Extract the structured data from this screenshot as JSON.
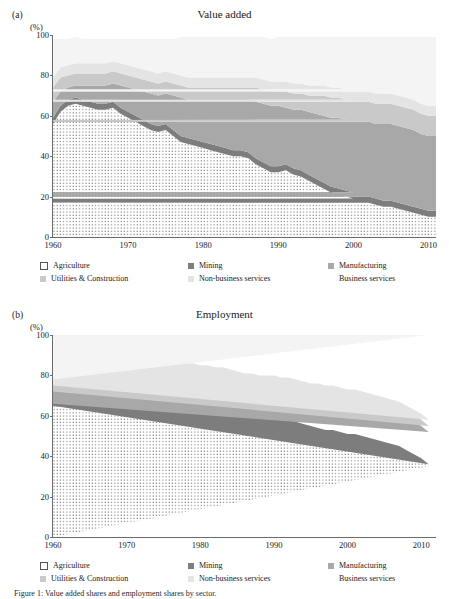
{
  "figure": {
    "caption": "Figure 1: Value added shares and employment shares by sector."
  },
  "legend": {
    "items": [
      {
        "label": "Agriculture",
        "key": "agriculture",
        "swatch": "sw-agri",
        "color": "#ffffff"
      },
      {
        "label": "Mining",
        "key": "mining",
        "swatch": "sw-min",
        "color": "#7d7d7d"
      },
      {
        "label": "Manufacturing",
        "key": "manufacturing",
        "swatch": "sw-man",
        "color": "#a8a8a8"
      },
      {
        "label": "Utilities & Construction",
        "key": "utilities",
        "swatch": "sw-uti",
        "color": "#c9c9c9"
      },
      {
        "label": "Non-business services",
        "key": "nonbusiness",
        "swatch": "sw-nbs",
        "color": "#e4e4e4"
      },
      {
        "label": "Business services",
        "key": "business",
        "swatch": "sw-bus",
        "color": "#f4f4f4"
      }
    ]
  },
  "panels": [
    {
      "letter": "(a)",
      "title": "Value added",
      "unit": "(%)"
    },
    {
      "letter": "(b)",
      "title": "Employment",
      "unit": "(%)"
    }
  ],
  "chart_data": [
    {
      "type": "area",
      "stacked": true,
      "title": "Value added",
      "panel": "(a)",
      "xlabel": "",
      "ylabel": "(%)",
      "ylim": [
        0,
        100
      ],
      "xlim": [
        1960,
        2011
      ],
      "yticks": [
        0,
        20,
        40,
        60,
        80,
        100
      ],
      "xticks": [
        1960,
        1970,
        1980,
        1990,
        2000,
        2010
      ],
      "grid": false,
      "legend_position": "below",
      "x": [
        1960,
        1961,
        1962,
        1963,
        1964,
        1965,
        1966,
        1967,
        1968,
        1969,
        1970,
        1971,
        1972,
        1973,
        1974,
        1975,
        1976,
        1977,
        1978,
        1979,
        1980,
        1981,
        1982,
        1983,
        1984,
        1985,
        1986,
        1987,
        1988,
        1989,
        1990,
        1991,
        1992,
        1993,
        1994,
        1995,
        1996,
        1997,
        1998,
        1999,
        2000,
        1,
        2002,
        2003,
        2004,
        2005,
        2006,
        2007,
        2008,
        2009,
        2010,
        2011
      ],
      "series": [
        {
          "name": "Agriculture",
          "values": [
            56,
            62,
            65,
            66,
            65,
            64,
            63,
            63,
            64,
            61,
            59,
            57,
            55,
            53,
            52,
            53,
            50,
            47,
            46,
            45,
            44,
            43,
            42,
            41,
            40,
            40,
            39,
            36,
            34,
            32,
            32,
            33,
            31,
            30,
            28,
            26,
            24,
            22,
            21,
            20,
            19,
            18,
            17,
            16,
            15,
            15,
            14,
            13,
            12,
            11,
            10,
            10
          ]
        },
        {
          "name": "Mining",
          "values": [
            3,
            3,
            3,
            3,
            3,
            3,
            3,
            3,
            3,
            3,
            3,
            3,
            3,
            3,
            3,
            3,
            3,
            3,
            3,
            3,
            3,
            3,
            3,
            3,
            3,
            3,
            3,
            3,
            3,
            3,
            3,
            3,
            3,
            3,
            3,
            3,
            3,
            3,
            3,
            3,
            3,
            3,
            3,
            3,
            3,
            3,
            3,
            3,
            3,
            3,
            3,
            3
          ]
        },
        {
          "name": "Manufacturing",
          "values": [
            8,
            7,
            6,
            6,
            7,
            8,
            9,
            9,
            9,
            11,
            12,
            13,
            14,
            15,
            15,
            15,
            17,
            19,
            19,
            20,
            21,
            22,
            23,
            24,
            25,
            25,
            26,
            28,
            29,
            30,
            30,
            28,
            29,
            30,
            31,
            32,
            33,
            34,
            35,
            35,
            36,
            36,
            37,
            37,
            38,
            38,
            38,
            38,
            38,
            37,
            37,
            37
          ]
        },
        {
          "name": "Utilities & Construction",
          "values": [
            7,
            7,
            6,
            6,
            6,
            6,
            6,
            6,
            6,
            6,
            6,
            6,
            6,
            6,
            6,
            6,
            6,
            6,
            6,
            6,
            6,
            6,
            6,
            6,
            6,
            6,
            6,
            7,
            7,
            7,
            7,
            8,
            8,
            8,
            8,
            9,
            10,
            10,
            10,
            10,
            10,
            10,
            10,
            10,
            10,
            10,
            10,
            10,
            10,
            10,
            10,
            10
          ]
        },
        {
          "name": "Non-business services",
          "values": [
            5,
            5,
            5,
            5,
            5,
            5,
            5,
            5,
            5,
            5,
            5,
            5,
            5,
            5,
            5,
            5,
            5,
            5,
            5,
            5,
            5,
            5,
            5,
            5,
            5,
            5,
            5,
            5,
            5,
            5,
            5,
            5,
            5,
            5,
            5,
            5,
            5,
            5,
            5,
            5,
            5,
            5,
            5,
            5,
            5,
            5,
            5,
            5,
            5,
            5,
            5,
            5
          ]
        },
        {
          "name": "Business services",
          "values": [
            19,
            14,
            13,
            13,
            12,
            12,
            12,
            12,
            11,
            12,
            13,
            14,
            15,
            16,
            17,
            16,
            17,
            19,
            20,
            20,
            20,
            20,
            20,
            20,
            20,
            20,
            20,
            20,
            21,
            21,
            22,
            22,
            23,
            23,
            24,
            24,
            24,
            25,
            25,
            26,
            26,
            27,
            27,
            28,
            28,
            28,
            29,
            30,
            31,
            33,
            34,
            34
          ]
        }
      ]
    },
    {
      "type": "area",
      "stacked": true,
      "title": "Employment",
      "panel": "(b)",
      "xlabel": "",
      "ylabel": "(%)",
      "ylim": [
        0,
        100
      ],
      "xlim": [
        1960,
        2012
      ],
      "yticks": [
        0,
        20,
        40,
        60,
        80,
        100
      ],
      "xticks": [
        1960,
        1970,
        1980,
        1990,
        2000,
        2010
      ],
      "grid": false,
      "legend_position": "below",
      "x": [
        1960,
        1961,
        1962,
        1963,
        1964,
        1965,
        1966,
        1967,
        1968,
        1969,
        1970,
        1971,
        1972,
        1973,
        1974,
        1975,
        1976,
        1977,
        1978,
        1979,
        1980,
        1981,
        1982,
        1983,
        1984,
        1985,
        1986,
        1987,
        1988,
        1989,
        1990,
        1991,
        1992,
        1993,
        1994,
        1995,
        1996,
        1997,
        1998,
        1999,
        2000,
        2001,
        2002,
        2003,
        2004,
        2005,
        2006,
        2007,
        2008,
        2009,
        2010,
        2011,
        2012
      ],
      "series": [
        {
          "name": "Agriculture",
          "values": [
            65,
            77,
            82,
            82,
            82,
            82,
            82,
            82,
            82,
            82,
            81,
            81,
            80,
            79,
            78,
            77,
            76,
            74,
            72,
            71,
            70,
            69,
            68,
            67,
            64,
            63,
            62,
            61,
            60,
            59,
            59,
            58,
            57,
            56,
            55,
            54,
            53,
            52,
            52,
            51,
            50,
            50,
            49,
            48,
            47,
            46,
            45,
            44,
            42,
            40,
            38,
            35
          ]
        },
        {
          "name": "Mining",
          "values": [
            1,
            1,
            1,
            1,
            1,
            1,
            1,
            1,
            1,
            1,
            1,
            1,
            1,
            1,
            1,
            1,
            1,
            1,
            1,
            1,
            1,
            1,
            1,
            1,
            1,
            1,
            1,
            1,
            1,
            1,
            1,
            1,
            1,
            1,
            1,
            1,
            1,
            1,
            1,
            1,
            1,
            1,
            1,
            1,
            1,
            1,
            1,
            1,
            1,
            1,
            1,
            1
          ]
        },
        {
          "name": "Manufacturing",
          "values": [
            6,
            7,
            5,
            5,
            5,
            5,
            6,
            6,
            6,
            6,
            6,
            6,
            6,
            6,
            6,
            6,
            6,
            7,
            7,
            8,
            8,
            9,
            9,
            10,
            12,
            12,
            12,
            13,
            13,
            14,
            14,
            14,
            15,
            15,
            15,
            15,
            16,
            16,
            16,
            16,
            16,
            16,
            16,
            16,
            16,
            16,
            16,
            16,
            16,
            16,
            16,
            16
          ]
        },
        {
          "name": "Utilities & Construction",
          "values": [
            3,
            4,
            3,
            3,
            3,
            3,
            3,
            3,
            3,
            3,
            3,
            3,
            3,
            3,
            3,
            3,
            3,
            3,
            3,
            3,
            3,
            3,
            3,
            3,
            3,
            3,
            3,
            3,
            3,
            3,
            3,
            3,
            3,
            3,
            3,
            3,
            3,
            3,
            3,
            3,
            3,
            3,
            3,
            3,
            3,
            3,
            3,
            3,
            3,
            3,
            3,
            3
          ]
        },
        {
          "name": "Non-business services",
          "values": [
            3,
            3,
            3,
            3,
            3,
            3,
            3,
            3,
            3,
            3,
            3,
            3,
            3,
            3,
            3,
            3,
            3,
            3,
            3,
            3,
            3,
            3,
            3,
            3,
            3,
            3,
            3,
            3,
            3,
            3,
            3,
            3,
            3,
            3,
            3,
            3,
            3,
            3,
            3,
            3,
            3,
            3,
            3,
            3,
            3,
            3,
            3,
            3,
            3,
            3,
            3,
            3
          ]
        },
        {
          "name": "Business services",
          "values": [
            22,
            8,
            6,
            6,
            6,
            6,
            5,
            5,
            5,
            5,
            6,
            6,
            7,
            8,
            9,
            10,
            11,
            13,
            15,
            14,
            15,
            16,
            16,
            16,
            17,
            18,
            19,
            19,
            20,
            20,
            20,
            21,
            21,
            22,
            23,
            24,
            24,
            25,
            25,
            26,
            27,
            27,
            28,
            29,
            30,
            31,
            32,
            33,
            35,
            37,
            39,
            42
          ]
        }
      ]
    }
  ]
}
